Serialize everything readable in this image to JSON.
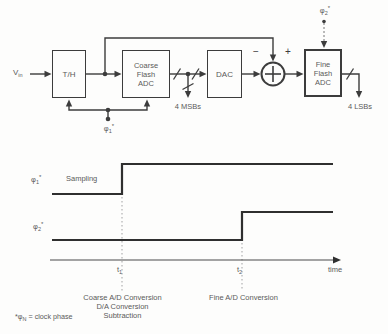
{
  "figure": {
    "title_semantic": "Two-step flash ADC block diagram with clock-phase timing diagram",
    "background_color": "#fdfdfc",
    "line_color": "#3c3c3c",
    "text_color": "#5a5a5a"
  },
  "block_diagram": {
    "vin": {
      "base": "V",
      "sub": "in"
    },
    "blocks": {
      "th": "T/H",
      "coarse": "Coarse\nFlash\nADC",
      "dac": "DAC",
      "fine": "Fine\nFlash\nADC"
    },
    "summer": {
      "minus": "−",
      "plus": "+"
    },
    "bus_labels": {
      "msb": "4 MSBs",
      "lsb": "4 LSBs"
    },
    "clocks": {
      "phi1": {
        "base": "φ",
        "sub": "1",
        "sup": "*"
      },
      "phi2": {
        "base": "φ",
        "sub": "2",
        "sup": "*"
      }
    }
  },
  "timing_diagram": {
    "row_labels": {
      "phi1": {
        "base": "φ",
        "sub": "1",
        "sup": "*"
      },
      "phi2": {
        "base": "φ",
        "sub": "2",
        "sup": "*"
      }
    },
    "sampling_label": "Sampling",
    "t1": {
      "base": "t",
      "sub": "1"
    },
    "t2": {
      "base": "t",
      "sub": "2"
    },
    "time_label": "time",
    "annotations": {
      "coarse_phase": "Coarse A/D Conversion\nD/A Conversion\nSubtraction",
      "fine_phase": "Fine A/D Conversion"
    },
    "footnote": {
      "pre": "*φ",
      "sub": "N",
      "rest": " = clock phase"
    },
    "waveforms": [
      {
        "name": "phi1",
        "description": "low before t1 (Sampling), high after t1"
      },
      {
        "name": "phi2",
        "description": "low before t2, high after t2"
      }
    ]
  }
}
